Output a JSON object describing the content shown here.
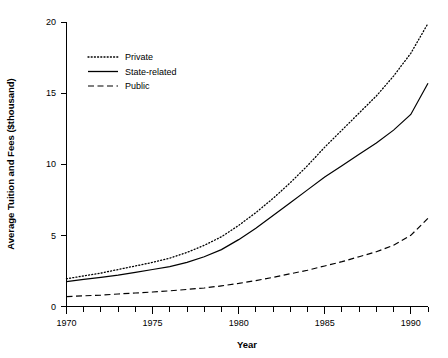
{
  "chart_data": {
    "type": "line",
    "title": "",
    "xlabel": "Year",
    "ylabel": "Average Tuition and Fees ($thousand)",
    "xlim": [
      1970,
      1991
    ],
    "ylim": [
      0,
      20
    ],
    "grid": false,
    "legend_position": "top-left-inside",
    "x_ticks_major": [
      1970,
      1975,
      1980,
      1985,
      1990
    ],
    "x_tick_labels": [
      "1970",
      "1975",
      "1980",
      "1985",
      "1990"
    ],
    "x_ticks_minor_every": 1,
    "y_ticks": [
      0,
      5,
      10,
      15,
      20
    ],
    "y_tick_labels": [
      "0",
      "5",
      "10",
      "15",
      "20"
    ],
    "x": [
      1970,
      1971,
      1972,
      1973,
      1974,
      1975,
      1976,
      1977,
      1978,
      1979,
      1980,
      1981,
      1982,
      1983,
      1984,
      1985,
      1986,
      1987,
      1988,
      1989,
      1990,
      1991
    ],
    "series": [
      {
        "name": "Private",
        "style": "dotted",
        "values": [
          1.95,
          2.15,
          2.35,
          2.6,
          2.85,
          3.1,
          3.4,
          3.8,
          4.3,
          4.9,
          5.7,
          6.6,
          7.6,
          8.7,
          9.9,
          11.2,
          12.4,
          13.6,
          14.8,
          16.2,
          17.8,
          19.9
        ]
      },
      {
        "name": "State-related",
        "style": "solid",
        "values": [
          1.75,
          1.9,
          2.05,
          2.2,
          2.4,
          2.6,
          2.8,
          3.1,
          3.5,
          4.0,
          4.7,
          5.5,
          6.4,
          7.3,
          8.2,
          9.1,
          9.9,
          10.7,
          11.5,
          12.4,
          13.5,
          15.7
        ]
      },
      {
        "name": "Public",
        "style": "dashed",
        "values": [
          0.7,
          0.75,
          0.8,
          0.88,
          0.95,
          1.02,
          1.1,
          1.2,
          1.3,
          1.45,
          1.62,
          1.82,
          2.05,
          2.3,
          2.55,
          2.85,
          3.15,
          3.5,
          3.85,
          4.3,
          5.0,
          6.2
        ]
      }
    ]
  },
  "legend": {
    "items": [
      {
        "label": "Private"
      },
      {
        "label": "State-related"
      },
      {
        "label": "Public"
      }
    ]
  },
  "colors": {
    "line": "#000000",
    "background": "#ffffff"
  }
}
